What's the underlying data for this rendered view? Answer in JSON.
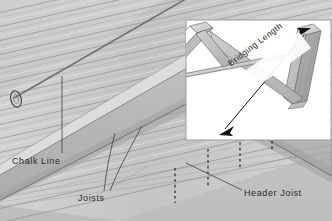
{
  "figure": {
    "background_color": "#c9c9c9",
    "line_color": "#4a4a4a",
    "label_color": "#2b2b2b"
  },
  "labels": {
    "chalk_line": "Chalk Line",
    "joists": "Joists",
    "header_joist": "Header Joist",
    "bridging_length": "Bridging Length"
  },
  "inset": {
    "name": "bridging-detail-panel",
    "background_color": "#ffffff",
    "border_color": "#9a9a9a",
    "dimension_label": "Bridging Length",
    "arrow_style": "double-headed"
  },
  "icons": {
    "chalk_reel": "chalk-line-reel-icon",
    "dimension_arrow": "double-arrow-icon"
  },
  "header_joist_marks": {
    "style": "dashed",
    "count": 4,
    "meaning": "joist locations"
  }
}
